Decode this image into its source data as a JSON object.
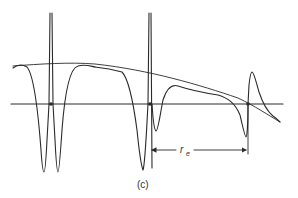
{
  "figure": {
    "panel_label": "(c)",
    "dimension_label": "r",
    "dimension_subscript": "e",
    "colors": {
      "ink": "#2a2a2a",
      "background": "#ffffff"
    },
    "elements": {
      "baseline": "horizontal reference axis",
      "envelope": "sloping straight envelope line",
      "signal": "oscillating signal curve with sharp dips and spikes",
      "markers": [
        "left-crossing-dot",
        "center-crossing-dot",
        "right-crossing-dot"
      ],
      "dimension": "double-headed arrow between center and right crossing points"
    }
  }
}
